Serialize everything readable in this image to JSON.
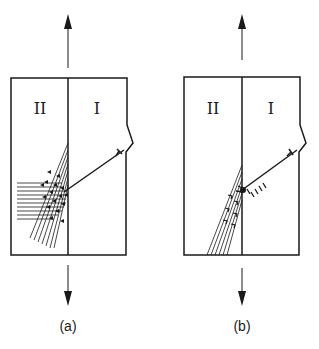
{
  "figure": {
    "panels": [
      {
        "id": "a",
        "caption": "(a)",
        "grain_left_label": "II",
        "grain_right_label": "I",
        "description": "Crack crossing grain boundary; many slip bands in grain II, horizontal and inclined sets"
      },
      {
        "id": "b",
        "caption": "(b)",
        "grain_left_label": "II",
        "grain_right_label": "I",
        "description": "Crack blunted at grain boundary with dislocation pile-up; inclined slip bands in grain II"
      }
    ],
    "colors": {
      "line": "#1a1a1a",
      "background": "#ffffff"
    }
  }
}
